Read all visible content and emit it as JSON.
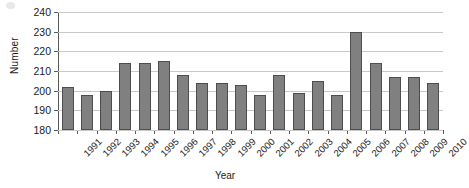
{
  "chart_data": {
    "type": "bar",
    "title": "",
    "xlabel": "Year",
    "ylabel": "Number",
    "categories": [
      "1991",
      "1992",
      "1993",
      "1994",
      "1995",
      "1996",
      "1997",
      "1998",
      "1999",
      "2000",
      "2001",
      "2002",
      "2003",
      "2004",
      "2005",
      "2006",
      "2007",
      "2008",
      "2009",
      "2010"
    ],
    "values": [
      202,
      198,
      200,
      214,
      214,
      215,
      208,
      204,
      204,
      203,
      198,
      208,
      199,
      205,
      198,
      230,
      214,
      207,
      207,
      204
    ],
    "ylim": [
      180,
      240
    ],
    "ytick_labels": [
      "240",
      "230",
      "220",
      "210",
      "200",
      "190",
      "180"
    ],
    "ytick_values": [
      240,
      230,
      220,
      210,
      200,
      190,
      180
    ],
    "grid": true,
    "legend": null,
    "series_color": "#808080",
    "bar_border_color": "#4d4d4d",
    "gridline_color": "#c9c9c9",
    "axis_color": "#58595b"
  }
}
